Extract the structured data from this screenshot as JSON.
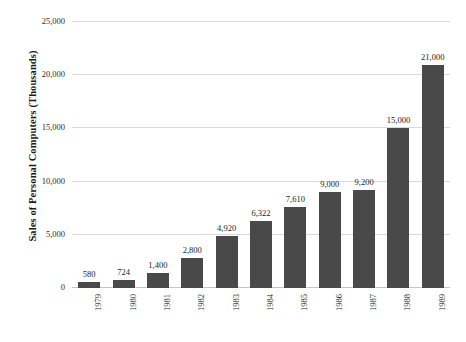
{
  "chart_data": {
    "type": "bar",
    "title": "",
    "subtitle": "",
    "xlabel": "",
    "ylabel": "Sales of Personal Computers (Thousands)",
    "categories": [
      "1979",
      "1980",
      "1981",
      "1982",
      "1983",
      "1984",
      "1985",
      "1986",
      "1987",
      "1988",
      "1989"
    ],
    "values": [
      580,
      724,
      1400,
      2800,
      4920,
      6322,
      7610,
      9000,
      9200,
      15000,
      21000
    ],
    "data_labels": [
      "580",
      "724",
      "1,400",
      "2,800",
      "4,920",
      "6,322",
      "7,610",
      "9,000",
      "9,200",
      "15,000",
      "21,000"
    ],
    "ylim": [
      0,
      25000
    ],
    "y_ticks": [
      0,
      5000,
      10000,
      15000,
      20000,
      25000
    ],
    "y_tick_labels": [
      "0",
      "5,000",
      "10,000",
      "15,000",
      "20,000",
      "25,000"
    ],
    "grid": "horizontal",
    "legend": "none",
    "series": [
      {
        "name": "Sales of Personal Computers (Thousands)",
        "values": [
          580,
          724,
          1400,
          2800,
          4920,
          6322,
          7610,
          9000,
          9200,
          15000,
          21000
        ]
      }
    ],
    "colors": {
      "bar": "#494949",
      "gridline": "#d9d9d9",
      "baseline": "#c6c6c6",
      "text": "#1d1d1d",
      "background": "#ffffff"
    }
  }
}
